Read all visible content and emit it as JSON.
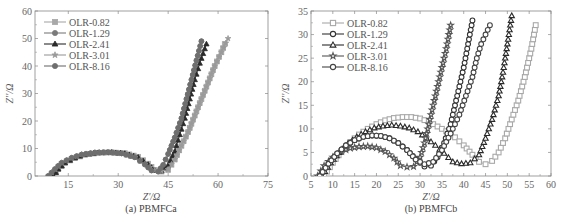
{
  "chart_data": [
    {
      "id": "a",
      "type": "scatter",
      "title": "(a) PBMFCa",
      "xlabel": "Z'/Ω",
      "ylabel": "Z''/Ω",
      "xlim": [
        5,
        75
      ],
      "ylim": [
        0,
        60
      ],
      "xticks": [
        15,
        30,
        45,
        60,
        75
      ],
      "yticks": [
        0,
        10,
        20,
        30,
        40,
        50,
        60
      ],
      "grid": false,
      "legend_position": "upper left",
      "series": [
        {
          "name": "OLR-0.82",
          "marker": "square",
          "filled": true,
          "color": "#a8a8a8",
          "x": [
            10.5,
            12,
            14,
            17,
            20,
            24,
            28,
            32,
            36,
            39,
            41,
            43,
            45,
            47,
            49,
            51,
            53,
            55,
            57,
            59,
            61,
            62
          ],
          "y": [
            0,
            2.5,
            4.8,
            6.5,
            7.7,
            8.4,
            8.6,
            8.3,
            7,
            4.5,
            2.2,
            1.6,
            2.2,
            6,
            11,
            16,
            22,
            28,
            34,
            40,
            45,
            48
          ]
        },
        {
          "name": "OLR-1.29",
          "marker": "circle",
          "filled": true,
          "color": "#7a7a7a",
          "x": [
            9,
            11,
            13,
            16,
            19,
            23,
            27,
            31,
            35,
            38,
            40,
            42,
            43.5,
            45,
            47,
            49,
            50.5,
            52,
            53.5,
            55
          ],
          "y": [
            0,
            2.5,
            4.8,
            6.6,
            7.8,
            8.5,
            8.6,
            8.2,
            6.8,
            4.2,
            2,
            1.6,
            4,
            8,
            14,
            21,
            28,
            35,
            42,
            49
          ]
        },
        {
          "name": "OLR-2.41",
          "marker": "triangle",
          "filled": true,
          "color": "#2a2a2a",
          "x": [
            10.5,
            12,
            14,
            17,
            20,
            24,
            28,
            32,
            36,
            39,
            41,
            43,
            45,
            47,
            48.5,
            50,
            51.5,
            53,
            54.5,
            56.5
          ],
          "y": [
            0,
            2.5,
            4.8,
            6.6,
            7.8,
            8.5,
            8.6,
            8.2,
            6.8,
            4.2,
            2,
            1.8,
            4,
            9,
            15,
            21,
            28,
            35,
            41,
            48
          ]
        },
        {
          "name": "OLR-3.01",
          "marker": "star",
          "filled": true,
          "color": "#9a9a9a",
          "x": [
            9,
            11,
            13,
            16,
            19,
            23,
            27,
            31,
            35,
            38,
            41,
            43,
            45,
            47,
            49,
            51,
            53,
            55,
            57,
            59,
            61,
            63
          ],
          "y": [
            0,
            2.5,
            4.8,
            6.6,
            7.8,
            8.5,
            8.6,
            8.2,
            6.8,
            4.2,
            2,
            1.8,
            2.4,
            6,
            11,
            16,
            22,
            28,
            34,
            40,
            45,
            50
          ]
        },
        {
          "name": "OLR-8.16",
          "marker": "circle",
          "filled": true,
          "color": "#6e6e6e",
          "x": [
            9,
            11,
            13,
            16,
            19,
            23,
            27,
            31,
            35,
            38,
            40,
            42,
            43.5,
            45,
            47,
            49,
            50.5,
            52,
            53.5,
            55
          ],
          "y": [
            0,
            2.5,
            4.8,
            6.6,
            7.8,
            8.5,
            8.6,
            8.2,
            6.8,
            4.2,
            2,
            1.6,
            4,
            8,
            14,
            21,
            28,
            35,
            42,
            49
          ]
        }
      ]
    },
    {
      "id": "b",
      "type": "scatter",
      "title": "(b) PBMFCb",
      "xlabel": "Z'/Ω",
      "ylabel": "Z''/Ω",
      "xlim": [
        5,
        60
      ],
      "ylim": [
        0,
        35
      ],
      "xticks": [
        5,
        10,
        15,
        20,
        25,
        30,
        35,
        40,
        45,
        50,
        55,
        60
      ],
      "yticks": [
        0,
        5,
        10,
        15,
        20,
        25,
        30,
        35
      ],
      "grid": false,
      "legend_position": "upper left",
      "series": [
        {
          "name": "OLR-0.82",
          "marker": "square",
          "filled": false,
          "color": "#a8a8a8",
          "x": [
            8,
            10,
            12,
            14,
            16,
            18,
            20,
            22,
            24,
            26,
            28,
            30,
            32,
            34,
            36,
            38,
            40,
            42,
            43.5,
            45,
            46.5,
            48,
            49.5,
            51,
            52.5,
            54,
            55.5,
            56.5
          ],
          "y": [
            0,
            2.8,
            5.2,
            7.2,
            8.8,
            10,
            11,
            11.8,
            12.3,
            12.5,
            12.5,
            12.2,
            11.5,
            10.5,
            9.5,
            8.2,
            6.5,
            4.5,
            3,
            2.5,
            3.2,
            5,
            8,
            12,
            16,
            21,
            27,
            32
          ]
        },
        {
          "name": "OLR-1.29",
          "marker": "circle",
          "filled": false,
          "color": "#333333",
          "x": [
            7,
            9,
            11,
            13,
            15,
            17,
            19,
            21,
            23,
            25,
            27,
            29,
            31,
            32.5,
            34,
            35.5,
            37,
            38,
            39,
            40,
            41,
            42
          ],
          "y": [
            0,
            2.6,
            4.8,
            6.5,
            7.6,
            8.3,
            8.6,
            8.5,
            8,
            7,
            5.5,
            3.6,
            2,
            2.2,
            4,
            7,
            11,
            15,
            19,
            23,
            28,
            33
          ]
        },
        {
          "name": "OLR-2.41",
          "marker": "triangle",
          "filled": false,
          "color": "#2a2a2a",
          "x": [
            7.5,
            9.5,
            11.5,
            13.5,
            15.5,
            17.5,
            19.5,
            21.5,
            23.5,
            25.5,
            27.5,
            29.5,
            31.5,
            33.5,
            35.5,
            37.5,
            39.5,
            41.5,
            43.5,
            45,
            46.5,
            48,
            49,
            50,
            51
          ],
          "y": [
            0,
            2.8,
            5,
            6.9,
            8.3,
            9.4,
            10.2,
            10.6,
            10.8,
            10.6,
            10.2,
            9.4,
            8,
            6.5,
            4.8,
            3,
            2.6,
            2.8,
            4.5,
            8,
            12,
            17,
            22,
            28,
            34
          ]
        },
        {
          "name": "OLR-3.01",
          "marker": "star",
          "filled": false,
          "color": "#555555",
          "x": [
            6.5,
            8,
            10,
            12,
            14,
            16,
            18,
            20,
            22,
            24,
            25.5,
            27,
            28.5,
            30,
            31,
            32,
            33,
            34,
            35,
            36,
            37
          ],
          "y": [
            0,
            2.2,
            4,
            5.2,
            5.9,
            6.2,
            6.3,
            6,
            5.2,
            3.8,
            2.2,
            1.9,
            2,
            4,
            7,
            11,
            15,
            19,
            23,
            27,
            32
          ]
        },
        {
          "name": "OLR-8.16",
          "marker": "circle",
          "filled": false,
          "color": "#444444",
          "x": [
            7,
            9,
            11,
            13,
            15,
            17,
            19,
            21,
            23,
            25,
            27,
            29,
            31,
            33,
            35,
            37,
            39,
            40.5,
            42,
            43,
            44,
            45,
            46
          ],
          "y": [
            0,
            2.6,
            4.8,
            6.5,
            7.6,
            8.3,
            8.6,
            8.5,
            8,
            7,
            5.5,
            3.5,
            2.5,
            3,
            5.5,
            9,
            13,
            17,
            21,
            25,
            28,
            30,
            32
          ]
        }
      ]
    }
  ]
}
